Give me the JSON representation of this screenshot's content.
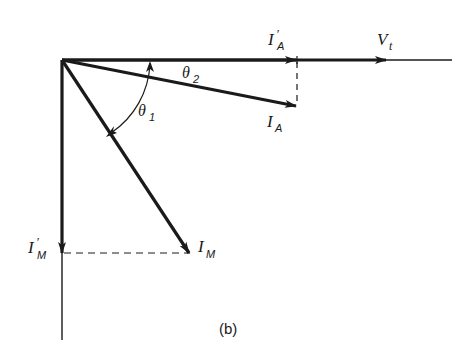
{
  "diagram": {
    "caption": "(b)",
    "type": "phasor diagram",
    "colors": {
      "stroke": "#1a1a1a",
      "background": "#ffffff"
    },
    "labels": {
      "vt": {
        "main": "V",
        "sub": "t"
      },
      "ia_prime": {
        "main": "I",
        "prime": "′",
        "sub": "A"
      },
      "ia": {
        "main": "I",
        "sub": "A"
      },
      "im": {
        "main": "I",
        "sub": "M"
      },
      "im_prime": {
        "main": "I",
        "prime": "′",
        "sub": "M"
      },
      "theta1": {
        "main": "θ",
        "sub": "1"
      },
      "theta2": {
        "main": "θ",
        "sub": "2"
      }
    },
    "vectors": [
      {
        "name": "V_t",
        "direction": "horizontal reference"
      },
      {
        "name": "I'_A",
        "direction": "horizontal, projection of I_A"
      },
      {
        "name": "I_A",
        "angle_label": "θ2"
      },
      {
        "name": "I_M",
        "angle_label": "θ1"
      },
      {
        "name": "I'_M",
        "direction": "vertical down, projection of I_M"
      }
    ]
  }
}
